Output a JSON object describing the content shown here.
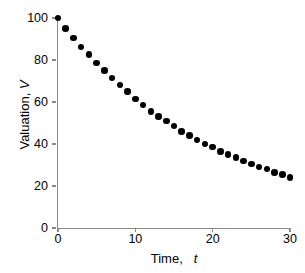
{
  "chart_data": {
    "type": "scatter",
    "title": "",
    "xlabel": "Time, t",
    "xlabel_plain": "Time,",
    "xlabel_italic": "t",
    "ylabel": "Valuation, V",
    "ylabel_plain": "Valuation,",
    "ylabel_italic": "V",
    "xlim": [
      0,
      30
    ],
    "ylim": [
      0,
      100
    ],
    "xticks": [
      0,
      10,
      20,
      30
    ],
    "yticks": [
      0,
      20,
      40,
      60,
      80,
      100
    ],
    "xtick_labels": [
      "0",
      "10",
      "20",
      "30"
    ],
    "ytick_labels": [
      "0",
      "20",
      "40",
      "60",
      "80",
      "100"
    ],
    "grid": false,
    "legend": null,
    "marker": "filled-circle",
    "marker_color": "#000000",
    "axis_color": "#8a8a8a",
    "background_color": "#ffffff",
    "x": [
      0,
      1,
      2,
      3,
      4,
      5,
      6,
      7,
      8,
      9,
      10,
      11,
      12,
      13,
      14,
      15,
      16,
      17,
      18,
      19,
      20,
      21,
      22,
      23,
      24,
      25,
      26,
      27,
      28,
      29,
      30
    ],
    "values": [
      100.0,
      95.2,
      90.5,
      86.2,
      82.3,
      78.7,
      75.3,
      72.2,
      59.3,
      66.7,
      64.2,
      61.9,
      59.7,
      57.6,
      55.7,
      53.9,
      52.2,
      50.6,
      49.0,
      47.6,
      46.2,
      44.9,
      43.7,
      42.5,
      41.4,
      40.3,
      39.3,
      38.3,
      37.4,
      36.5,
      35.6
    ],
    "series": [
      {
        "name": "Valuation",
        "values": [
          100.0,
          95.3,
          90.9,
          86.7,
          82.8,
          79.1,
          75.6,
          72.3,
          69.1,
          66.2,
          63.4,
          60.8,
          58.3,
          55.9,
          53.7,
          51.6,
          49.6,
          47.7,
          45.9,
          44.2,
          42.6,
          41.1,
          39.6,
          38.2,
          36.9,
          35.7,
          34.5,
          33.4,
          32.3,
          31.3,
          30.3
        ]
      }
    ],
    "plotted_values": [
      100.0,
      95.0,
      90.5,
      86.2,
      82.5,
      78.5,
      75.0,
      71.5,
      68.0,
      65.0,
      61.5,
      58.5,
      55.5,
      53.0,
      51.0,
      48.5,
      46.0,
      44.0,
      42.0,
      40.0,
      38.5,
      36.5,
      35.0,
      33.5,
      32.0,
      30.5,
      29.0,
      28.0,
      26.5,
      25.5,
      24.0
    ]
  }
}
